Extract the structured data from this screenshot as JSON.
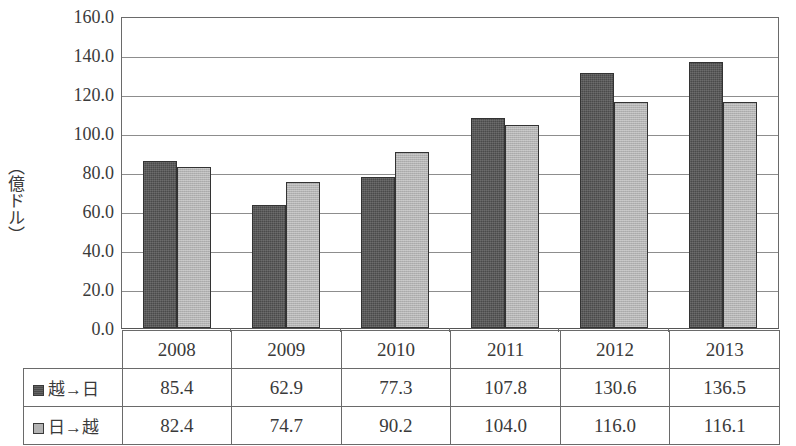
{
  "chart_data": {
    "type": "bar",
    "title": "",
    "subtitle": "",
    "xlabel": "",
    "ylabel": "（億ドル）",
    "categories": [
      "2008",
      "2009",
      "2010",
      "2011",
      "2012",
      "2013"
    ],
    "series": [
      {
        "name": "越→日",
        "values": [
          85.4,
          62.9,
          77.3,
          107.8,
          130.6,
          136.5
        ],
        "color": "#4a4a4a"
      },
      {
        "name": "日→越",
        "values": [
          82.4,
          74.7,
          90.2,
          104.0,
          116.0,
          116.1
        ],
        "color": "#b3b3b3"
      }
    ],
    "ylim": [
      0.0,
      160.0
    ],
    "ytick_step": 20.0,
    "yticks": [
      "160.0",
      "140.0",
      "120.0",
      "100.0",
      "80.0",
      "60.0",
      "40.0",
      "20.0",
      "0.0"
    ],
    "grid": true,
    "legend_position": "table-left-column",
    "value_labels_in_table": true
  },
  "table": {
    "corner_label": "",
    "header": [
      "",
      "2008",
      "2009",
      "2010",
      "2011",
      "2012",
      "2013"
    ],
    "rows": [
      {
        "legend": "越→日",
        "swatch": "dark-square-icon",
        "values": [
          "85.4",
          "62.9",
          "77.3",
          "107.8",
          "130.6",
          "136.5"
        ]
      },
      {
        "legend": "日→越",
        "swatch": "light-square-icon",
        "values": [
          "82.4",
          "74.7",
          "90.2",
          "104.0",
          "116.0",
          "116.1"
        ]
      }
    ]
  },
  "axis": {
    "y_title": "（億ドル）",
    "y_tick_labels": [
      "160.0",
      "140.0",
      "120.0",
      "100.0",
      "80.0",
      "60.0",
      "40.0",
      "20.0",
      "0.0"
    ]
  },
  "colors": {
    "series_1": "#4a4a4a",
    "series_2": "#b3b3b3",
    "axis_line": "#6a6a6a",
    "grid_line": "#8d8d8d",
    "text": "#3a3a3a",
    "background": "#ffffff"
  }
}
